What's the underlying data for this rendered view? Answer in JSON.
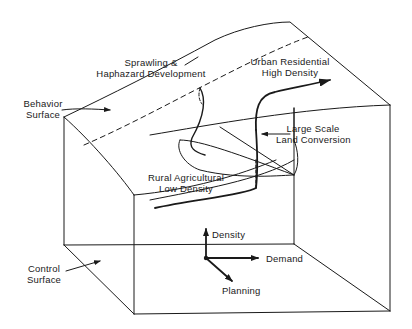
{
  "diagram": {
    "type": "catastrophe-cusp-surface",
    "colors": {
      "line": "#1a1a1a",
      "background": "#ffffff"
    },
    "labels": {
      "behavior_surface": {
        "line1": "Behavior",
        "line2": "Surface"
      },
      "control_surface": {
        "line1": "Control",
        "line2": "Surface"
      },
      "sprawling": {
        "line1": "Sprawling &",
        "line2": "Haphazard Development"
      },
      "urban": {
        "line1": "Urban Residential",
        "line2": "High Density"
      },
      "large_scale": {
        "line1": "Large Scale",
        "line2": "Land Conversion"
      },
      "rural": {
        "line1": "Rural Agricultural",
        "line2": "Low Density"
      }
    },
    "axes": {
      "density": "Density",
      "demand": "Demand",
      "planning": "Planning"
    }
  }
}
